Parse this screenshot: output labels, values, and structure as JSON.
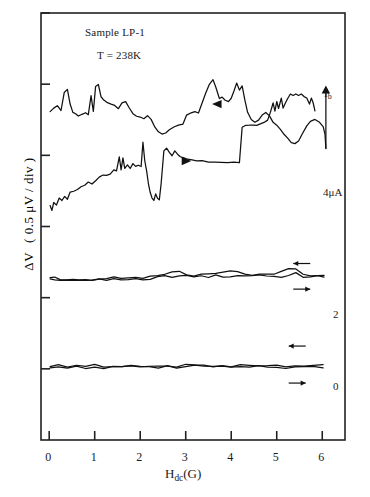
{
  "figure": {
    "annotations": {
      "sample": "Sample LP-1",
      "temperature": "T = 238K",
      "current_symbol_main": "I",
      "current_symbol_sub": "b",
      "curve_label_4uA": "4μA",
      "curve_label_2": "2",
      "curve_label_0": "0"
    }
  },
  "chart_data": {
    "type": "line",
    "title": "Sample LP-1",
    "subtitle": "T = 238K",
    "xlabel": "H_dc(G)",
    "ylabel": "ΔV ( 0.5 μV / div )",
    "xlabel_parts": {
      "main": "H",
      "sub": "dc",
      "tail": "(G)"
    },
    "ylabel_parts": {
      "delta": "ΔV",
      "units": "( 0.5 μV / div )"
    },
    "xlim": [
      -0.18,
      6.5
    ],
    "ylim": [
      0,
      6
    ],
    "grid": false,
    "legend": "none",
    "x_ticks": [
      0,
      1,
      2,
      3,
      4,
      5,
      6
    ],
    "x_tick_labels": [
      "0",
      "1",
      "2",
      "3",
      "4",
      "5",
      "6"
    ],
    "y_ticks": [
      1,
      2,
      3,
      4,
      5,
      6
    ],
    "y_tick_labels": [
      "",
      "",
      "",
      "",
      "",
      ""
    ],
    "axis_note": "y axis ticks unlabeled; each division equals 0.5 microvolts",
    "colors": {
      "trace": "#111111",
      "axis": "#222222",
      "background": "#ffffff"
    },
    "series": [
      {
        "name": "Ib = 4 microamps, sweep down",
        "group": "4uA",
        "direction": "decreasing",
        "marker": "left-triangle",
        "marker_at": [
          3.7,
          4.72
        ],
        "points": [
          [
            0.02,
            4.62
          ],
          [
            0.1,
            4.66
          ],
          [
            0.18,
            4.7
          ],
          [
            0.26,
            4.63
          ],
          [
            0.33,
            4.88
          ],
          [
            0.4,
            4.93
          ],
          [
            0.46,
            4.72
          ],
          [
            0.52,
            4.6
          ],
          [
            0.58,
            4.58
          ],
          [
            0.64,
            4.55
          ],
          [
            0.72,
            4.58
          ],
          [
            0.8,
            4.6
          ],
          [
            0.86,
            4.57
          ],
          [
            0.92,
            4.84
          ],
          [
            0.97,
            4.62
          ],
          [
            1.02,
            4.97
          ],
          [
            1.08,
            5.0
          ],
          [
            1.14,
            4.82
          ],
          [
            1.2,
            4.78
          ],
          [
            1.28,
            4.74
          ],
          [
            1.36,
            4.72
          ],
          [
            1.44,
            4.7
          ],
          [
            1.52,
            4.66
          ],
          [
            1.6,
            4.74
          ],
          [
            1.68,
            4.76
          ],
          [
            1.76,
            4.67
          ],
          [
            1.84,
            4.58
          ],
          [
            1.92,
            4.55
          ],
          [
            2.0,
            4.54
          ],
          [
            2.08,
            4.52
          ],
          [
            2.16,
            4.56
          ],
          [
            2.24,
            4.5
          ],
          [
            2.32,
            4.4
          ],
          [
            2.4,
            4.33
          ],
          [
            2.48,
            4.3
          ],
          [
            2.56,
            4.31
          ],
          [
            2.64,
            4.36
          ],
          [
            2.74,
            4.4
          ],
          [
            2.84,
            4.43
          ],
          [
            2.94,
            4.44
          ],
          [
            3.02,
            4.56
          ],
          [
            3.12,
            4.6
          ],
          [
            3.2,
            4.62
          ],
          [
            3.28,
            4.6
          ],
          [
            3.36,
            4.74
          ],
          [
            3.44,
            4.88
          ],
          [
            3.52,
            5.0
          ],
          [
            3.6,
            5.06
          ],
          [
            3.66,
            4.96
          ],
          [
            3.74,
            4.8
          ],
          [
            3.8,
            4.82
          ],
          [
            3.86,
            4.78
          ],
          [
            3.94,
            4.76
          ],
          [
            4.0,
            4.8
          ],
          [
            4.06,
            4.9
          ],
          [
            4.12,
            5.02
          ],
          [
            4.18,
            4.92
          ],
          [
            4.24,
            4.98
          ],
          [
            4.3,
            4.78
          ],
          [
            4.36,
            4.6
          ],
          [
            4.44,
            4.5
          ],
          [
            4.52,
            4.46
          ],
          [
            4.6,
            4.5
          ],
          [
            4.68,
            4.56
          ],
          [
            4.76,
            4.6
          ],
          [
            4.84,
            4.55
          ],
          [
            4.92,
            4.46
          ],
          [
            5.0,
            4.42
          ],
          [
            5.08,
            4.36
          ],
          [
            5.16,
            4.3
          ],
          [
            5.24,
            4.24
          ],
          [
            5.32,
            4.18
          ],
          [
            5.4,
            4.16
          ],
          [
            5.48,
            4.2
          ],
          [
            5.56,
            4.3
          ],
          [
            5.66,
            4.42
          ],
          [
            5.74,
            4.48
          ],
          [
            5.84,
            4.5
          ],
          [
            5.94,
            4.46
          ],
          [
            6.02,
            4.4
          ],
          [
            6.06,
            4.3
          ],
          [
            6.08,
            4.1
          ]
        ]
      },
      {
        "name": "Ib = 4 microamps, sweep up",
        "group": "4uA",
        "direction": "increasing",
        "marker": "right-triangle",
        "marker_at": [
          3.0,
          3.92
        ],
        "points": [
          [
            0.02,
            3.3
          ],
          [
            0.06,
            3.22
          ],
          [
            0.1,
            3.34
          ],
          [
            0.16,
            3.3
          ],
          [
            0.22,
            3.4
          ],
          [
            0.28,
            3.36
          ],
          [
            0.34,
            3.42
          ],
          [
            0.4,
            3.38
          ],
          [
            0.46,
            3.48
          ],
          [
            0.54,
            3.5
          ],
          [
            0.62,
            3.52
          ],
          [
            0.7,
            3.56
          ],
          [
            0.78,
            3.58
          ],
          [
            0.86,
            3.62
          ],
          [
            0.94,
            3.6
          ],
          [
            1.02,
            3.64
          ],
          [
            1.1,
            3.7
          ],
          [
            1.18,
            3.72
          ],
          [
            1.26,
            3.72
          ],
          [
            1.34,
            3.74
          ],
          [
            1.42,
            3.8
          ],
          [
            1.48,
            3.78
          ],
          [
            1.54,
            3.98
          ],
          [
            1.58,
            3.8
          ],
          [
            1.62,
            3.96
          ],
          [
            1.66,
            3.82
          ],
          [
            1.72,
            3.86
          ],
          [
            1.78,
            3.82
          ],
          [
            1.84,
            3.88
          ],
          [
            1.9,
            3.84
          ],
          [
            1.96,
            3.86
          ],
          [
            2.02,
            3.84
          ],
          [
            2.06,
            4.18
          ],
          [
            2.1,
            3.92
          ],
          [
            2.14,
            3.78
          ],
          [
            2.18,
            3.6
          ],
          [
            2.22,
            3.48
          ],
          [
            2.26,
            3.4
          ],
          [
            2.3,
            3.36
          ],
          [
            2.34,
            3.46
          ],
          [
            2.38,
            3.4
          ],
          [
            2.42,
            3.38
          ],
          [
            2.46,
            3.6
          ],
          [
            2.52,
            4.06
          ],
          [
            2.58,
            4.1
          ],
          [
            2.64,
            4.04
          ],
          [
            2.7,
            4.0
          ],
          [
            2.76,
            4.06
          ],
          [
            2.82,
            4.02
          ],
          [
            2.88,
            3.98
          ],
          [
            2.96,
            3.96
          ],
          [
            3.04,
            3.94
          ],
          [
            3.14,
            3.94
          ],
          [
            3.24,
            3.92
          ],
          [
            3.36,
            3.92
          ],
          [
            3.5,
            3.9
          ],
          [
            3.64,
            3.9
          ],
          [
            3.78,
            3.9
          ],
          [
            3.92,
            3.9
          ],
          [
            4.06,
            3.9
          ],
          [
            4.18,
            3.9
          ],
          [
            4.24,
            4.4
          ],
          [
            4.32,
            4.42
          ],
          [
            4.4,
            4.42
          ],
          [
            4.48,
            4.42
          ],
          [
            4.56,
            4.42
          ],
          [
            4.64,
            4.44
          ],
          [
            4.72,
            4.46
          ],
          [
            4.8,
            4.5
          ],
          [
            4.86,
            4.6
          ],
          [
            4.92,
            4.74
          ],
          [
            4.96,
            4.62
          ],
          [
            5.0,
            4.76
          ],
          [
            5.04,
            4.66
          ],
          [
            5.1,
            4.8
          ],
          [
            5.14,
            4.66
          ],
          [
            5.18,
            4.72
          ],
          [
            5.24,
            4.8
          ],
          [
            5.3,
            4.86
          ],
          [
            5.36,
            4.84
          ],
          [
            5.42,
            4.86
          ],
          [
            5.48,
            4.84
          ],
          [
            5.54,
            4.86
          ],
          [
            5.6,
            4.82
          ],
          [
            5.66,
            4.8
          ],
          [
            5.72,
            4.72
          ],
          [
            5.76,
            4.8
          ],
          [
            5.8,
            4.74
          ],
          [
            5.84,
            4.62
          ]
        ]
      },
      {
        "name": "Ib = 2 microamps, sweep pair",
        "group": "2",
        "direction": "both",
        "points": [
          [
            0.02,
            2.28
          ],
          [
            0.12,
            2.26
          ],
          [
            0.24,
            2.25
          ],
          [
            0.38,
            2.24
          ],
          [
            0.52,
            2.25
          ],
          [
            0.66,
            2.24
          ],
          [
            0.8,
            2.23
          ],
          [
            0.94,
            2.24
          ],
          [
            1.1,
            2.25
          ],
          [
            1.26,
            2.24
          ],
          [
            1.42,
            2.26
          ],
          [
            1.58,
            2.25
          ],
          [
            1.74,
            2.26
          ],
          [
            1.9,
            2.27
          ],
          [
            2.06,
            2.26
          ],
          [
            2.22,
            2.27
          ],
          [
            2.38,
            2.28
          ],
          [
            2.54,
            2.3
          ],
          [
            2.7,
            2.28
          ],
          [
            2.86,
            2.29
          ],
          [
            3.02,
            2.3
          ],
          [
            3.18,
            2.29
          ],
          [
            3.34,
            2.31
          ],
          [
            3.5,
            2.3
          ],
          [
            3.66,
            2.31
          ],
          [
            3.82,
            2.3
          ],
          [
            3.98,
            2.31
          ],
          [
            4.14,
            2.3
          ],
          [
            4.3,
            2.31
          ],
          [
            4.46,
            2.3
          ],
          [
            4.62,
            2.31
          ],
          [
            4.78,
            2.3
          ],
          [
            4.94,
            2.31
          ],
          [
            5.1,
            2.3
          ],
          [
            5.26,
            2.32
          ],
          [
            5.42,
            2.34
          ],
          [
            5.58,
            2.3
          ],
          [
            5.74,
            2.29
          ],
          [
            5.9,
            2.3
          ],
          [
            6.04,
            2.3
          ]
        ]
      },
      {
        "name": "Ib = 0 microamps, sweep pair",
        "group": "0",
        "direction": "both",
        "points": [
          [
            0.02,
            1.03
          ],
          [
            0.2,
            1.03
          ],
          [
            0.4,
            1.02
          ],
          [
            0.6,
            1.03
          ],
          [
            0.8,
            1.02
          ],
          [
            1.0,
            1.03
          ],
          [
            1.2,
            1.02
          ],
          [
            1.4,
            1.03
          ],
          [
            1.6,
            1.02
          ],
          [
            1.8,
            1.03
          ],
          [
            2.0,
            1.02
          ],
          [
            2.2,
            1.03
          ],
          [
            2.4,
            1.02
          ],
          [
            2.6,
            1.03
          ],
          [
            2.8,
            1.02
          ],
          [
            3.0,
            1.03
          ],
          [
            3.2,
            1.04
          ],
          [
            3.4,
            1.03
          ],
          [
            3.6,
            1.02
          ],
          [
            3.8,
            1.03
          ],
          [
            4.0,
            1.02
          ],
          [
            4.2,
            1.03
          ],
          [
            4.4,
            1.02
          ],
          [
            4.6,
            1.03
          ],
          [
            4.8,
            1.02
          ],
          [
            5.0,
            1.03
          ],
          [
            5.2,
            1.02
          ],
          [
            5.4,
            1.03
          ],
          [
            5.6,
            1.02
          ],
          [
            5.8,
            1.03
          ],
          [
            6.02,
            1.03
          ]
        ]
      }
    ],
    "direction_arrows": [
      {
        "at_label": "2",
        "direction": "left",
        "x": 5.55,
        "y": 2.48
      },
      {
        "at_label": "2",
        "direction": "right",
        "x": 5.55,
        "y": 2.12
      },
      {
        "at_label": "0",
        "direction": "left",
        "x": 5.45,
        "y": 1.32
      },
      {
        "at_label": "0",
        "direction": "right",
        "x": 5.45,
        "y": 0.8
      }
    ]
  }
}
